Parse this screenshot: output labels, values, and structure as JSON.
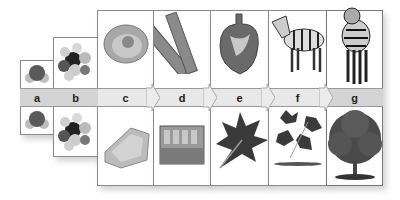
{
  "diagram": {
    "levels": [
      {
        "key": "a",
        "label": "a",
        "top": "water molecule",
        "bottom": "water molecule"
      },
      {
        "key": "b",
        "label": "b",
        "top": "organic molecule",
        "bottom": "organic molecule"
      },
      {
        "key": "c",
        "label": "c",
        "top": "animal cell",
        "bottom": "plant cell"
      },
      {
        "key": "d",
        "label": "d",
        "top": "muscle tissue",
        "bottom": "plant tissue"
      },
      {
        "key": "e",
        "label": "e",
        "top": "heart (organ)",
        "bottom": "leaf (organ)"
      },
      {
        "key": "f",
        "label": "f",
        "top": "zebra (organ system / organism)",
        "bottom": "branch with leaves"
      },
      {
        "key": "g",
        "label": "g",
        "top": "zebra (organism)",
        "bottom": "tree (organism)"
      }
    ],
    "colors": {
      "border": "#8a8a8a",
      "band": "#d4d4d4",
      "label": "#222222"
    }
  }
}
